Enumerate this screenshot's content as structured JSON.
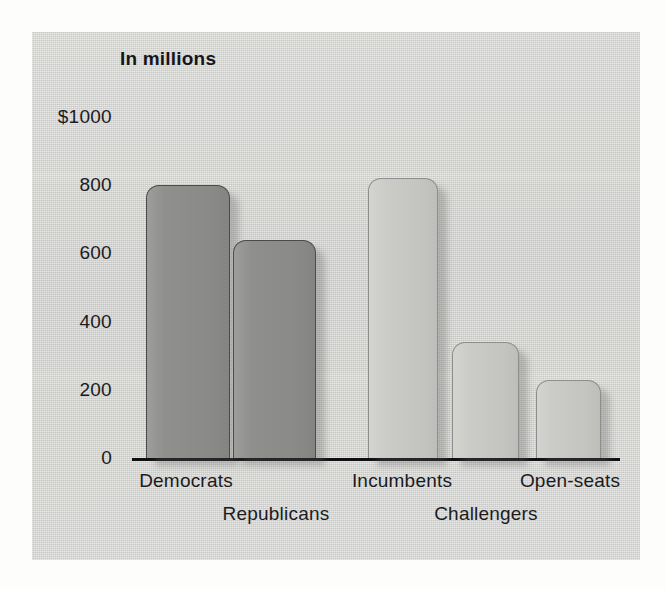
{
  "figure": {
    "title": "In millions",
    "panel_color": "#d7d7d4",
    "axis_color": "#101013",
    "text_color": "#1b1b1e"
  },
  "chart_data": {
    "type": "bar",
    "title": "In millions",
    "xlabel": "",
    "ylabel": "",
    "ylim": [
      0,
      1000
    ],
    "grid": false,
    "legend": null,
    "y_ticks": [
      0,
      200,
      400,
      600,
      800,
      1000
    ],
    "y_tick_labels": [
      "0",
      "200",
      "400",
      "600",
      "800",
      "$1000"
    ],
    "categories": [
      "Democrats",
      "Republicans",
      "Incumbents",
      "Challengers",
      "Open-seats"
    ],
    "values": [
      800,
      640,
      820,
      340,
      230
    ],
    "bar_colors": [
      "#8f8f8e",
      "#8f8f8e",
      "#c9c9c6",
      "#c9c9c6",
      "#c9c9c6"
    ],
    "groups": [
      {
        "name": "By party",
        "categories": [
          "Democrats",
          "Republicans"
        ],
        "values": [
          800,
          640
        ],
        "shade": "dark"
      },
      {
        "name": "By candidate status",
        "categories": [
          "Incumbents",
          "Challengers",
          "Open-seats"
        ],
        "values": [
          820,
          340,
          230
        ],
        "shade": "light"
      }
    ],
    "units": "millions of dollars"
  },
  "y_axis": {
    "ticks": [
      {
        "label": "$1000",
        "value": 1000
      },
      {
        "label": "800",
        "value": 800
      },
      {
        "label": "600",
        "value": 600
      },
      {
        "label": "400",
        "value": 400
      },
      {
        "label": "200",
        "value": 200
      },
      {
        "label": "0",
        "value": 0
      }
    ]
  },
  "x_axis": {
    "labels": [
      {
        "text": "Democrats",
        "row": 0
      },
      {
        "text": "Republicans",
        "row": 1
      },
      {
        "text": "Incumbents",
        "row": 0
      },
      {
        "text": "Challengers",
        "row": 1
      },
      {
        "text": "Open-seats",
        "row": 0
      }
    ]
  }
}
